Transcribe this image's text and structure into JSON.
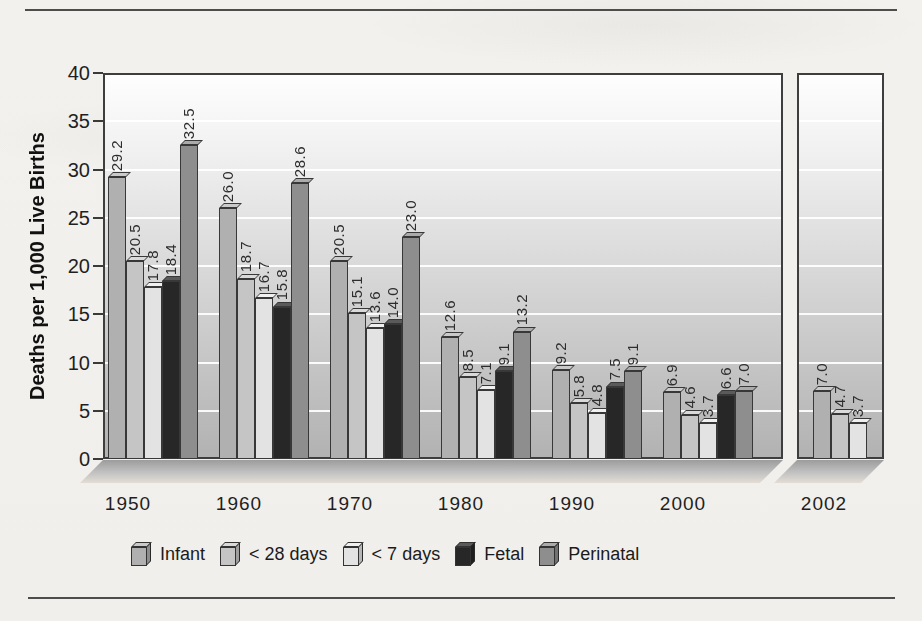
{
  "chart_data": {
    "type": "bar",
    "title": "",
    "xlabel": "",
    "ylabel": "Deaths per 1,000 Live Births",
    "ylim": [
      0,
      40
    ],
    "yticks": [
      0,
      5,
      10,
      15,
      20,
      25,
      30,
      35,
      40
    ],
    "grid": "horizontal-white-lines",
    "legend_position": "bottom",
    "value_label_format": "0.0",
    "value_label_style": "rotated-90-above-bar",
    "broken_axis": {
      "enabled": true,
      "separate_panel_category": "2002"
    },
    "categories": [
      "1950",
      "1960",
      "1970",
      "1980",
      "1990",
      "2000",
      "2002"
    ],
    "series": [
      {
        "name": "Infant",
        "color": "#b0b0b0",
        "top_color": "#cacaca",
        "values": [
          29.2,
          26.0,
          20.5,
          12.6,
          9.2,
          6.9,
          7.0
        ]
      },
      {
        "name": "< 28 days",
        "color": "#c5c5c5",
        "top_color": "#dadada",
        "values": [
          20.5,
          18.7,
          15.1,
          8.5,
          5.8,
          4.6,
          4.7
        ]
      },
      {
        "name": "< 7 days",
        "color": "#e3e3e3",
        "top_color": "#f0f0f0",
        "values": [
          17.8,
          16.7,
          13.6,
          7.1,
          4.8,
          3.7,
          3.7
        ]
      },
      {
        "name": "Fetal",
        "color": "#272727",
        "top_color": "#5a5a5a",
        "values": [
          18.4,
          15.8,
          14.0,
          9.1,
          7.5,
          6.6,
          null
        ]
      },
      {
        "name": "Perinatal",
        "color": "#8e8e8e",
        "top_color": "#ababab",
        "values": [
          32.5,
          28.6,
          23.0,
          13.2,
          9.1,
          7.0,
          null
        ]
      }
    ],
    "bar_outline_color": "#383838"
  }
}
